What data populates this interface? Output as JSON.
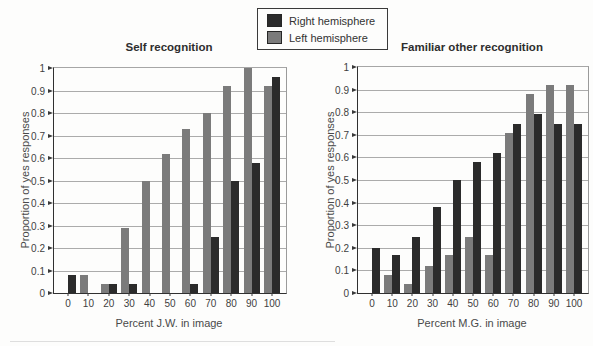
{
  "legend": {
    "items": [
      {
        "label": "Right hemisphere",
        "color": "#2b2b2b"
      },
      {
        "label": "Left hemisphere",
        "color": "#7b7b7b"
      }
    ]
  },
  "chart_data": [
    {
      "type": "bar",
      "title": "Self recognition",
      "xlabel": "Percent J.W. in image",
      "ylabel": "Proportion of yes responses",
      "categories": [
        "0",
        "10",
        "20",
        "30",
        "40",
        "50",
        "60",
        "70",
        "80",
        "90",
        "100"
      ],
      "ylim": [
        0,
        1
      ],
      "yticks": [
        0,
        0.1,
        0.2,
        0.3,
        0.4,
        0.5,
        0.6,
        0.7,
        0.8,
        0.9,
        1
      ],
      "ytick_labels": [
        "0",
        "0.1",
        "0.2",
        "0.3",
        "0.4",
        "0.5",
        "0.6",
        "0.7",
        "0.8",
        "0.9",
        "1"
      ],
      "grid": true,
      "legend_position": "top-center",
      "series": [
        {
          "name": "Left hemisphere",
          "slot": "left",
          "color": "#7b7b7b",
          "values": [
            0,
            0.08,
            0.04,
            0.29,
            0.5,
            0.62,
            0.73,
            0.8,
            0.92,
            1.0,
            0.92
          ]
        },
        {
          "name": "Right hemisphere",
          "slot": "right",
          "color": "#2b2b2b",
          "values": [
            0.08,
            0,
            0.04,
            0.04,
            0,
            0,
            0.04,
            0.25,
            0.5,
            0.58,
            0.96
          ]
        }
      ]
    },
    {
      "type": "bar",
      "title": "Familiar other recognition",
      "xlabel": "Percent M.G. in image",
      "ylabel": "Proportion of yes responses",
      "categories": [
        "0",
        "10",
        "20",
        "30",
        "40",
        "50",
        "60",
        "70",
        "80",
        "90",
        "100"
      ],
      "ylim": [
        0,
        1
      ],
      "yticks": [
        0,
        0.1,
        0.2,
        0.3,
        0.4,
        0.5,
        0.6,
        0.7,
        0.8,
        0.9,
        1
      ],
      "ytick_labels": [
        "0",
        "0.1",
        "0.2",
        "0.3",
        "0.4",
        "0.5",
        "0.6",
        "0.7",
        "0.8",
        "0.9",
        "1"
      ],
      "grid": true,
      "legend_position": "top-center",
      "series": [
        {
          "name": "Left hemisphere",
          "slot": "left",
          "color": "#7b7b7b",
          "values": [
            0,
            0.08,
            0.04,
            0.12,
            0.17,
            0.25,
            0.17,
            0.71,
            0.88,
            0.92,
            0.92
          ]
        },
        {
          "name": "Right hemisphere",
          "slot": "right",
          "color": "#2b2b2b",
          "values": [
            0.2,
            0.17,
            0.25,
            0.38,
            0.5,
            0.58,
            0.62,
            0.75,
            0.79,
            0.75,
            0.75
          ]
        }
      ]
    }
  ]
}
